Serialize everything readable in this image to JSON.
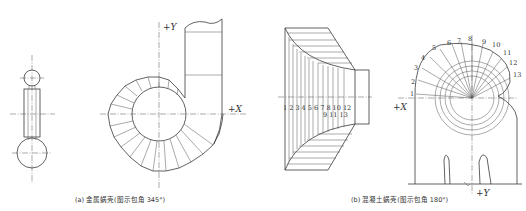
{
  "figure_a": {
    "caption": "(a) 金属蜗壳(图示包角 345°)",
    "axis_y_label": "+Y",
    "axis_x_label": "+X"
  },
  "figure_b": {
    "caption": "(b) 混凝土蜗壳(图示包角 180°)",
    "axis_x_label": "+X",
    "axis_y_label": "+Y",
    "section_numbers_arc": [
      "1",
      "2",
      "3",
      "4",
      "5",
      "6",
      "7",
      "8",
      "9",
      "10",
      "11",
      "12",
      "13"
    ],
    "section_numbers_row1": "1 2 3 4 5 6 7 8  10 12",
    "section_numbers_row2": "9  11 13"
  }
}
